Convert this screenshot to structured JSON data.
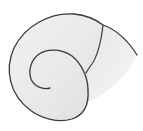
{
  "image": {
    "subject": "spiral-shell-illustration",
    "background": "#ffffff",
    "shell_fill": "#ebebeb",
    "shell_fill_light": "#f4f4f4",
    "outline_color": "#3a3a3a"
  }
}
